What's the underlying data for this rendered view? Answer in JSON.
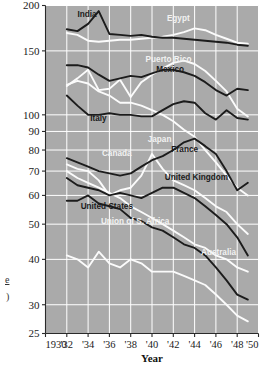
{
  "chart_data": {
    "type": "line",
    "title": "",
    "subtitle": "",
    "xlabel": "Year",
    "ylabel": "Rate",
    "yscale": "log",
    "ylim": [
      25,
      200
    ],
    "xlim": [
      1930,
      1950
    ],
    "grid": true,
    "legend": "inline-labels",
    "plot_background": "#aaaaaa",
    "gridline_color": "#ffffff",
    "ytick_labels": [
      "200",
      "150",
      "100",
      "90",
      "80",
      "70",
      "60",
      "50",
      "40",
      "30",
      "25"
    ],
    "ytick_values": [
      200,
      150,
      100,
      90,
      80,
      70,
      60,
      50,
      40,
      30,
      25
    ],
    "xtick_labels": [
      "1930",
      "'32",
      "'34",
      "'36",
      "'38",
      "'40",
      "'42",
      "'44",
      "'46",
      "'48",
      "'50"
    ],
    "xtick_values": [
      1930,
      1932,
      1934,
      1936,
      1938,
      1940,
      1942,
      1944,
      1946,
      1948,
      1950
    ],
    "x": [
      1932,
      1933,
      1934,
      1935,
      1936,
      1937,
      1938,
      1939,
      1940,
      1941,
      1942,
      1943,
      1944,
      1945,
      1946,
      1947,
      1948,
      1949
    ],
    "series": [
      {
        "name": "India",
        "color": "#1c1c1c",
        "style": "dark",
        "label_x": 1933.0,
        "label_y": 186,
        "values": [
          172,
          170,
          178,
          193,
          167,
          166,
          165,
          166,
          164,
          163,
          163,
          162,
          161,
          160,
          159,
          158,
          156,
          155
        ]
      },
      {
        "name": "Egypt",
        "color": "#fbfbfb",
        "style": "light",
        "label_x": 1941.4,
        "label_y": 181,
        "values": [
          168,
          166,
          160,
          159,
          160,
          161,
          161,
          162,
          163,
          164,
          166,
          169,
          173,
          171,
          166,
          162,
          158,
          157
        ]
      },
      {
        "name": "Puerto Rico",
        "color": "#fbfbfb",
        "style": "light",
        "label_x": 1939.4,
        "label_y": 140,
        "values": [
          120,
          126,
          133,
          117,
          118,
          125,
          112,
          123,
          129,
          134,
          139,
          141,
          138,
          132,
          124,
          116,
          104,
          99
        ]
      },
      {
        "name": "Mexico",
        "color": "#1c1c1c",
        "style": "dark",
        "label_x": 1940.4,
        "label_y": 131,
        "values": [
          137,
          137,
          135,
          129,
          124,
          126,
          128,
          127,
          130,
          133,
          133,
          131,
          128,
          123,
          117,
          113,
          118,
          117
        ]
      },
      {
        "name": "Italy",
        "color": "#1c1c1c",
        "style": "dark",
        "label_x": 1934.2,
        "label_y": 96,
        "values": [
          113,
          106,
          100,
          100,
          101,
          100,
          100,
          99,
          99,
          103,
          107,
          109,
          108,
          101,
          97,
          103,
          98,
          97
        ]
      },
      {
        "name": "Japan",
        "color": "#fbfbfb",
        "style": "light",
        "label_x": 1939.6,
        "label_y": 84,
        "values": [
          121,
          124,
          122,
          116,
          113,
          108,
          108,
          106,
          103,
          100,
          96,
          91,
          87,
          80,
          74,
          68,
          63,
          60
        ]
      },
      {
        "name": "France",
        "color": "#1c1c1c",
        "style": "dark",
        "label_x": 1941.8,
        "label_y": 79,
        "values": [
          76,
          74,
          72,
          70,
          69,
          68,
          69,
          72,
          75,
          77,
          80,
          84,
          86,
          82,
          78,
          70,
          62,
          65
        ]
      },
      {
        "name": "Canada",
        "color": "#fbfbfb",
        "style": "light",
        "label_x": 1935.3,
        "label_y": 77,
        "values": [
          73,
          71,
          70,
          66,
          60,
          62,
          63,
          68,
          78,
          71,
          66,
          64,
          62,
          59,
          56,
          54,
          50,
          47
        ]
      },
      {
        "name": "United Kingdom",
        "color": "#1c1c1c",
        "style": "dark",
        "label_x": 1941.2,
        "label_y": 66,
        "values": [
          67,
          64,
          63,
          62,
          60,
          61,
          60,
          59,
          61,
          63,
          63,
          61,
          59,
          56,
          53,
          50,
          46,
          41
        ]
      },
      {
        "name": "United States",
        "color": "#1c1c1c",
        "style": "dark",
        "label_x": 1933.3,
        "label_y": 55,
        "values": [
          58,
          58,
          60,
          57,
          56,
          55,
          52,
          51,
          49,
          48,
          46,
          44,
          43,
          41,
          38,
          35,
          32,
          31
        ]
      },
      {
        "name": "Union of S. Africa",
        "color": "#fbfbfb",
        "style": "light",
        "label_x": 1935.2,
        "label_y": 50,
        "values": [
          70,
          67,
          65,
          63,
          61,
          59,
          56,
          54,
          52,
          50,
          48,
          46,
          44,
          43,
          41,
          40,
          38,
          37
        ]
      },
      {
        "name": "Australia",
        "color": "#fbfbfb",
        "style": "light",
        "label_x": 1944.6,
        "label_y": 41,
        "values": [
          41,
          40,
          38,
          42,
          39,
          38,
          40,
          39,
          37,
          37,
          37,
          36,
          35,
          34,
          32,
          30,
          28,
          27
        ]
      }
    ]
  },
  "axes": {
    "ylabel_fragment_top": "e",
    "ylabel_fragment_bottom": ")",
    "xaxis_title": "Year"
  }
}
